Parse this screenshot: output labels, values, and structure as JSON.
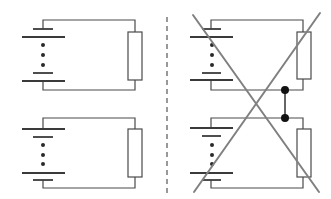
{
  "diagram": {
    "title": "",
    "colors": {
      "wire": "#4a4a4a",
      "cross_out": "#808080",
      "junction": "#111111",
      "divider": "#555555"
    },
    "circuits": [
      {
        "id": "top-left",
        "panel": "left",
        "battery_polarity": "short-plate-top",
        "x0": 43,
        "x1": 135,
        "y_top": 20,
        "y_bot": 90,
        "resistor": {
          "x": 128,
          "y": 32,
          "w": 14,
          "h": 48
        }
      },
      {
        "id": "bottom-left",
        "panel": "left",
        "battery_polarity": "long-plate-top",
        "x0": 43,
        "x1": 135,
        "y_top": 118,
        "y_bot": 188,
        "resistor": {
          "x": 128,
          "y": 129,
          "w": 14,
          "h": 48
        }
      },
      {
        "id": "top-right",
        "panel": "right",
        "battery_polarity": "short-plate-top",
        "x0": 211,
        "x1": 303,
        "y_top": 20,
        "y_bot": 90,
        "resistor": {
          "x": 297,
          "y": 32,
          "w": 14,
          "h": 48
        }
      },
      {
        "id": "bottom-right",
        "panel": "right",
        "battery_polarity": "long-plate-top",
        "x0": 211,
        "x1": 303,
        "y_top": 118,
        "y_bot": 188,
        "resistor": {
          "x": 297,
          "y": 129,
          "w": 14,
          "h": 48
        }
      }
    ],
    "junction_link": {
      "x": 285,
      "y1": 90,
      "y2": 118
    },
    "cross_out": {
      "line1": [
        193,
        15,
        319,
        192
      ],
      "line2": [
        320,
        13,
        194,
        192
      ]
    },
    "divider": {
      "x": 167,
      "y1": 17,
      "y2": 195,
      "style": "dashed"
    }
  }
}
